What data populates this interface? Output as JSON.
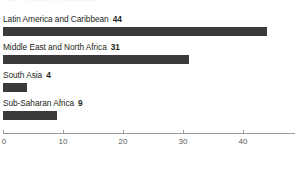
{
  "chart_data": {
    "type": "bar",
    "orientation": "horizontal",
    "title": "",
    "xlabel": "",
    "ylabel": "",
    "categories": [
      "Latin America and Caribbean",
      "Middle East and North Africa",
      "South Asia",
      "Sub-Saharan Africa"
    ],
    "values": [
      44,
      31,
      4,
      9
    ],
    "value_labels": [
      "44",
      "31",
      "4",
      "9"
    ],
    "xlim": [
      0,
      48.5
    ],
    "xticks": [
      0,
      10,
      20,
      30,
      40
    ],
    "xtick_labels": [
      "0",
      "10",
      "20",
      "30",
      "40"
    ],
    "grid": false,
    "legend": null,
    "series": [
      {
        "name": "value",
        "values": [
          44,
          31,
          4,
          9
        ]
      }
    ]
  },
  "style": {
    "bar_color": "#3a3a3a",
    "axis_color": "#9b9b9b",
    "text_color": "#231f20",
    "tick_label_color": "#58595b",
    "background": "#ffffff"
  },
  "clipped_header_text": "Latin America and Caribbean 44"
}
